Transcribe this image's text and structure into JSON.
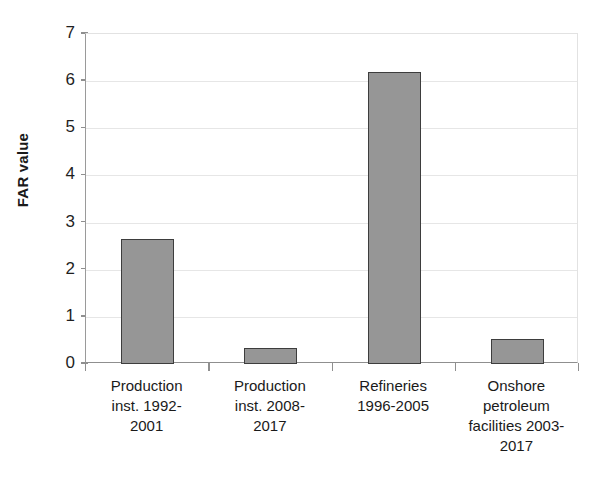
{
  "chart_data": {
    "type": "bar",
    "title": "",
    "subtitle": "",
    "xlabel": "",
    "ylabel": "FAR value",
    "ylim": [
      0,
      7
    ],
    "yticks": [
      0,
      1,
      2,
      3,
      4,
      5,
      6,
      7
    ],
    "ytick_labels": [
      "0",
      "1",
      "2",
      "3",
      "4",
      "5",
      "6",
      "7"
    ],
    "grid": true,
    "grid_axis": "y",
    "legend": false,
    "legend_position": "none",
    "bar_fill_color": "#969696",
    "bar_edge_color": "#3d3d3d",
    "gridline_color": "#e6e6e6",
    "axis_color": "#8f8f8f",
    "categories": [
      "Production inst. 1992-2001",
      "Production inst. 2008-2017",
      "Refineries 1996-2005",
      "Onshore petroleum facilities 2003-2017"
    ],
    "category_label_lines": [
      [
        "Production",
        "inst. 1992-",
        "2001"
      ],
      [
        "Production",
        "inst. 2008-",
        "2017"
      ],
      [
        "Refineries",
        "1996-2005"
      ],
      [
        "Onshore",
        "petroleum",
        "facilities 2003-",
        "2017"
      ]
    ],
    "values": [
      2.66,
      0.34,
      6.2,
      0.53
    ]
  }
}
